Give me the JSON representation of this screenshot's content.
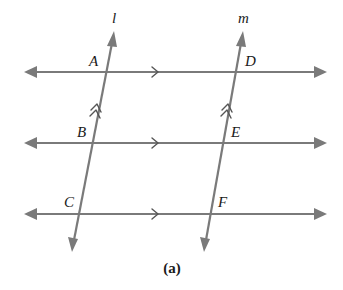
{
  "diagram": {
    "caption": "(a)",
    "colors": {
      "line": "#7a7a7a",
      "text": "#1a1a1a",
      "background": "#ffffff"
    },
    "transversals": [
      {
        "name": "l",
        "label": "l",
        "top": [
          114,
          33
        ],
        "bottom": [
          72,
          250
        ],
        "mark": "double-arrow"
      },
      {
        "name": "m",
        "label": "m",
        "top": [
          243,
          33
        ],
        "bottom": [
          204,
          250
        ],
        "mark": "double-arrow"
      }
    ],
    "parallel_lines": [
      {
        "y": 72,
        "x_start": 25,
        "x_end": 325,
        "mark": "single-arrow"
      },
      {
        "y": 143,
        "x_start": 25,
        "x_end": 325,
        "mark": "single-arrow"
      },
      {
        "y": 214,
        "x_start": 25,
        "x_end": 325,
        "mark": "single-arrow"
      }
    ],
    "points": [
      {
        "label": "A",
        "line": "l",
        "row": 1
      },
      {
        "label": "B",
        "line": "l",
        "row": 2
      },
      {
        "label": "C",
        "line": "l",
        "row": 3
      },
      {
        "label": "D",
        "line": "m",
        "row": 1
      },
      {
        "label": "E",
        "line": "m",
        "row": 2
      },
      {
        "label": "F",
        "line": "m",
        "row": 3
      }
    ]
  }
}
